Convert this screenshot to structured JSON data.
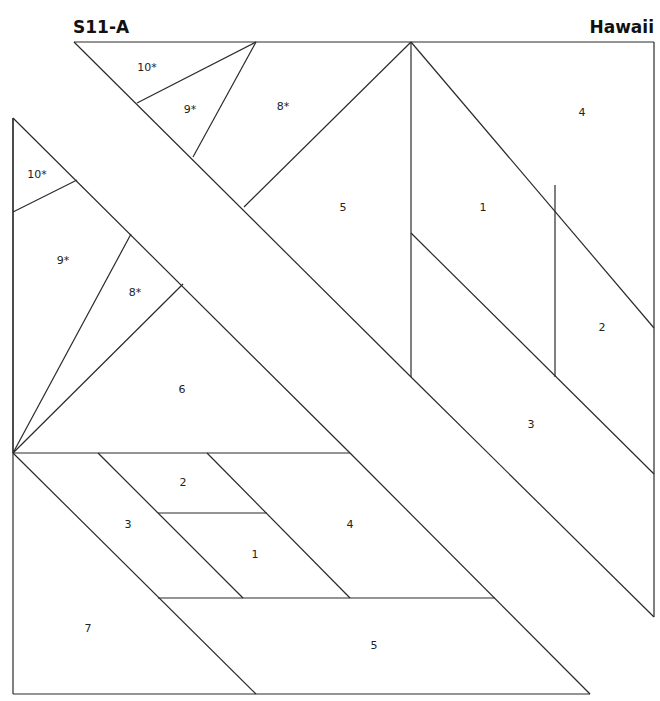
{
  "header": {
    "pattern_id": "S11-A",
    "pattern_name": "Hawaii"
  },
  "upper_section_labels": [
    {
      "id": "u10",
      "label": "10*",
      "x": 147,
      "y": 71
    },
    {
      "id": "u9",
      "label": "9*",
      "x": 190,
      "y": 113
    },
    {
      "id": "u8",
      "label": "8*",
      "x": 283,
      "y": 110
    },
    {
      "id": "u5",
      "label": "5",
      "x": 343,
      "y": 211
    },
    {
      "id": "u1",
      "label": "1",
      "x": 483,
      "y": 211
    },
    {
      "id": "u4",
      "label": "4",
      "x": 582,
      "y": 116
    },
    {
      "id": "u2",
      "label": "2",
      "x": 602,
      "y": 331
    },
    {
      "id": "u3",
      "label": "3",
      "x": 531,
      "y": 428
    }
  ],
  "left_section_labels": [
    {
      "id": "l10",
      "label": "10*",
      "x": 37,
      "y": 178
    },
    {
      "id": "l9",
      "label": "9*",
      "x": 63,
      "y": 264
    },
    {
      "id": "l8",
      "label": "8*",
      "x": 135,
      "y": 296
    },
    {
      "id": "l6",
      "label": "6",
      "x": 182,
      "y": 393
    }
  ],
  "lower_section_labels": [
    {
      "id": "b2",
      "label": "2",
      "x": 183,
      "y": 486
    },
    {
      "id": "b3",
      "label": "3",
      "x": 128,
      "y": 528
    },
    {
      "id": "b1",
      "label": "1",
      "x": 255,
      "y": 558
    },
    {
      "id": "b4",
      "label": "4",
      "x": 350,
      "y": 528
    },
    {
      "id": "b7",
      "label": "7",
      "x": 88,
      "y": 632
    },
    {
      "id": "b5",
      "label": "5",
      "x": 374,
      "y": 649
    }
  ]
}
